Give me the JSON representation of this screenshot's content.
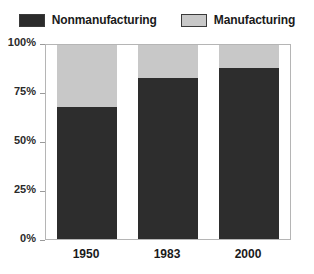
{
  "chart_data": {
    "type": "bar",
    "subtype": "stacked-percent",
    "title": "",
    "xlabel": "",
    "ylabel": "",
    "categories": [
      "1950",
      "1983",
      "2000"
    ],
    "series": [
      {
        "name": "Nonmanufacturing",
        "color": "#2d2d2d",
        "values": [
          68,
          83,
          88
        ]
      },
      {
        "name": "Manufacturing",
        "color": "#c8c8c8",
        "values": [
          32,
          17,
          12
        ]
      }
    ],
    "ylim": [
      0,
      100
    ],
    "yticks": [
      "0%",
      "25%",
      "50%",
      "75%",
      "100%"
    ],
    "ytick_values": [
      0,
      25,
      50,
      75,
      100
    ],
    "grid": false,
    "legend_position": "top"
  },
  "legend": {
    "entries": [
      {
        "label": "Nonmanufacturing",
        "swatch": "dark-swatch-icon"
      },
      {
        "label": "Manufacturing",
        "swatch": "light-swatch-icon"
      }
    ]
  },
  "colors": {
    "nonmanufacturing": "#2d2d2d",
    "manufacturing": "#c8c8c8",
    "frame": "#b5b5b5",
    "text": "#1a1a1a",
    "background": "#ffffff"
  }
}
